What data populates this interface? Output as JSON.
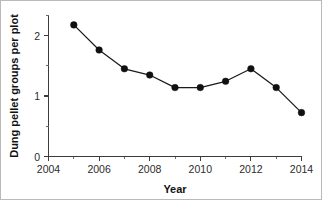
{
  "chart_data": {
    "type": "line",
    "title": "",
    "xlabel": "Year",
    "ylabel": "Dung pellet groups per plot",
    "x": [
      2005,
      2006,
      2007,
      2008,
      2009,
      2010,
      2011,
      2012,
      2013,
      2014
    ],
    "values": [
      2.1,
      1.7,
      1.4,
      1.3,
      1.1,
      1.1,
      1.2,
      1.4,
      1.1,
      0.7
    ],
    "series": [
      {
        "name": "Dung pellet groups per plot",
        "values": [
          2.1,
          1.7,
          1.4,
          1.3,
          1.1,
          1.1,
          1.2,
          1.4,
          1.1,
          0.7
        ]
      }
    ],
    "xlim": [
      2004,
      2014
    ],
    "ylim": [
      0,
      2.25
    ],
    "x_ticks": [
      2004,
      2006,
      2008,
      2010,
      2012,
      2014
    ],
    "x_tick_labels": [
      "2004",
      "2006",
      "2008",
      "2010",
      "2012",
      "2014"
    ],
    "x_minor_ticks": [
      2005,
      2007,
      2009,
      2011,
      2013
    ],
    "y_ticks": [
      0,
      1,
      2
    ],
    "y_tick_labels": [
      "0",
      "1",
      "2"
    ],
    "y_minor_ticks": [
      0.5,
      1.5,
      2.0
    ],
    "grid": false,
    "legend": null,
    "marker": "filled-circle",
    "line_color": "#1a1a1a",
    "marker_color": "#101010"
  },
  "axes": {
    "x_title": "Year",
    "y_title": "Dung pellet groups per plot"
  },
  "ticks": {
    "y": [
      "2",
      "1",
      "0"
    ],
    "x": [
      "2004",
      "2006",
      "2008",
      "2010",
      "2012",
      "2014"
    ]
  }
}
